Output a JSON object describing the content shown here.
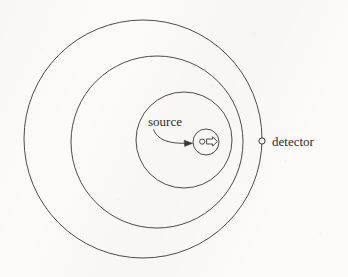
{
  "figure": {
    "type": "concentric-wavefront-diagram",
    "background_color": "#fbfaf8",
    "stroke_color": "#3a3733",
    "labels": {
      "source": "source",
      "detector": "detector"
    },
    "elements": {
      "outer_circle": {
        "name": "outer-wavefront-circle",
        "cx": 143,
        "cy": 139,
        "r": 119
      },
      "middle_circle": {
        "name": "middle-wavefront-circle",
        "cx": 157,
        "cy": 142,
        "r": 86
      },
      "inner_circle": {
        "name": "inner-wavefront-circle",
        "cx": 184,
        "cy": 140,
        "r": 48
      },
      "source_circle": {
        "name": "source-particle-circle",
        "cx": 206,
        "cy": 142,
        "r": 13
      },
      "source_dot": {
        "name": "source-particle-dot",
        "cx": 202,
        "cy": 142,
        "r": 2.6
      },
      "velocity_arrow": {
        "name": "velocity-arrow",
        "direction": "right"
      },
      "detector_dot": {
        "name": "detector-point",
        "cx": 262,
        "cy": 141,
        "r": 3.1
      },
      "source_leader": {
        "name": "source-leader-arrow"
      }
    },
    "label_positions": {
      "source": {
        "x": 148,
        "y": 126
      },
      "detector": {
        "x": 272,
        "y": 146
      }
    },
    "font_sizes": {
      "source": 13,
      "detector": 13
    }
  }
}
